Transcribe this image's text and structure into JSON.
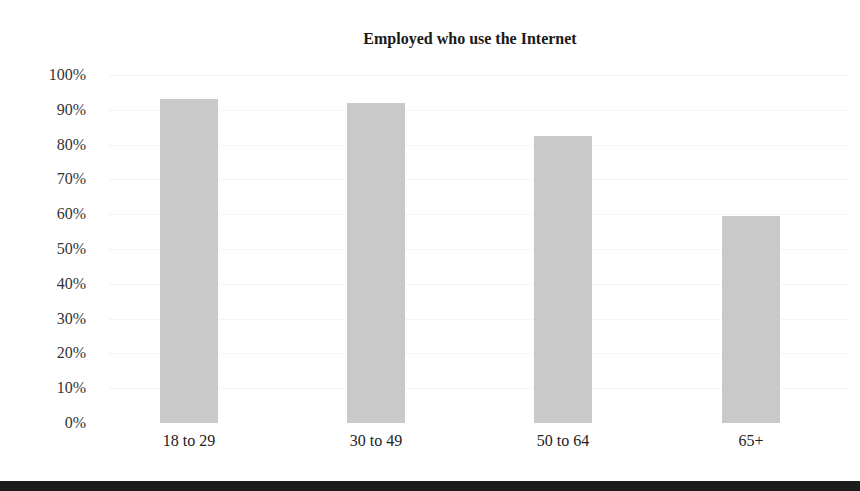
{
  "chart_data": {
    "type": "bar",
    "title": "Employed who use the Internet",
    "xlabel": "",
    "ylabel": "",
    "categories": [
      "18 to 29",
      "30 to 49",
      "50 to 64",
      "65+"
    ],
    "values": [
      93,
      92,
      82.5,
      59.5
    ],
    "unit": "%",
    "ylim": [
      0,
      100
    ],
    "yticks": [
      "0%",
      "10%",
      "20%",
      "30%",
      "40%",
      "50%",
      "60%",
      "70%",
      "80%",
      "90%",
      "100%"
    ],
    "grid": true,
    "legend": null,
    "colors": {
      "bar": "#c9c9c9",
      "rule": "#1c1c1c"
    }
  }
}
